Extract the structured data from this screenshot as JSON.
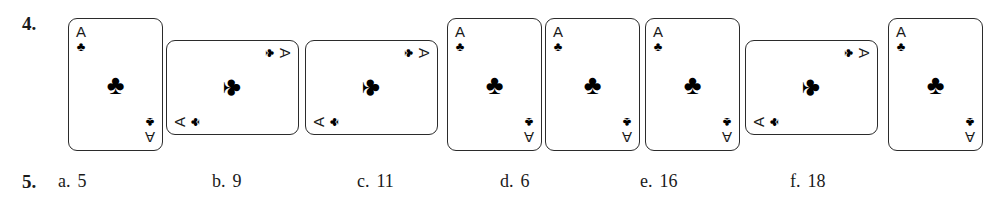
{
  "question_4": {
    "number": "4.",
    "cards": [
      {
        "rank": "A",
        "suit_glyph": "♣",
        "orientation": "portrait",
        "rotation_deg": 0,
        "left": 68,
        "top": 18
      },
      {
        "rank": "A",
        "suit_glyph": "♣",
        "orientation": "landscape",
        "rotation_deg": 90,
        "left": 185,
        "top": 21
      },
      {
        "rank": "A",
        "suit_glyph": "♣",
        "orientation": "landscape",
        "rotation_deg": 90,
        "left": 324,
        "top": 21
      },
      {
        "rank": "A",
        "suit_glyph": "♣",
        "orientation": "portrait",
        "rotation_deg": 0,
        "left": 447,
        "top": 18
      },
      {
        "rank": "A",
        "suit_glyph": "♣",
        "orientation": "portrait",
        "rotation_deg": 0,
        "left": 545,
        "top": 18
      },
      {
        "rank": "A",
        "suit_glyph": "♣",
        "orientation": "portrait",
        "rotation_deg": 0,
        "left": 645,
        "top": 18
      },
      {
        "rank": "A",
        "suit_glyph": "♣",
        "orientation": "landscape",
        "rotation_deg": 90,
        "left": 764,
        "top": 21
      },
      {
        "rank": "A",
        "suit_glyph": "♣",
        "orientation": "portrait",
        "rotation_deg": 0,
        "left": 888,
        "top": 18
      }
    ]
  },
  "question_5": {
    "number": "5.",
    "options": [
      {
        "letter": "a.",
        "value": "5",
        "left": 58
      },
      {
        "letter": "b.",
        "value": "9",
        "left": 212
      },
      {
        "letter": "c.",
        "value": "11",
        "left": 357
      },
      {
        "letter": "d.",
        "value": "6",
        "left": 500
      },
      {
        "letter": "e.",
        "value": "16",
        "left": 640
      },
      {
        "letter": "f.",
        "value": "18",
        "left": 790
      }
    ]
  },
  "colors": {
    "ink": "#1a1a1a",
    "card_border": "#2b2b2b",
    "pip": "#000000",
    "page_background": "#ffffff"
  }
}
